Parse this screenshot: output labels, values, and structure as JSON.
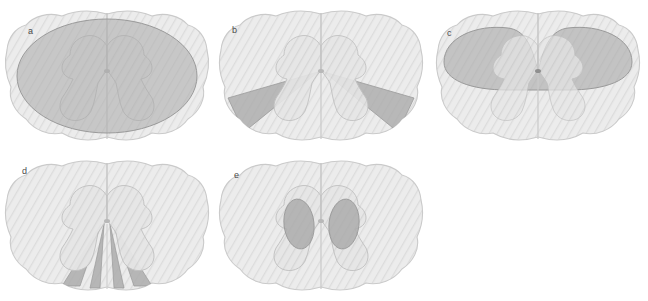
{
  "figure": {
    "background_color": "#ffffff",
    "width": 648,
    "height": 301,
    "panel_count": 5
  },
  "colors": {
    "background": "#ffffff",
    "cord_fill": "#e9e9e9",
    "cord_outline": "#c9c9c9",
    "hatch_line": "#dcdcdc",
    "gray_matter_fill": "#e2e2e2",
    "gray_matter_outline": "#c2c2c2",
    "lesion_fill": "#a9a9a9",
    "lesion_outline": "#9a9a9a",
    "midline_color": "#c4c4c4",
    "label_color": "#4a4a4a"
  },
  "panels": [
    {
      "id": "a",
      "label": "a",
      "label_x": 28,
      "label_y": 27,
      "lesion_pattern": "complete-transverse-lesion",
      "lesion_description": "Large central ellipse covering nearly the entire cord cross-section including all white and gray matter",
      "lesion_count": 1
    },
    {
      "id": "b",
      "label": "b",
      "label_x": 232,
      "label_y": 26,
      "lesion_pattern": "bilateral-anterolateral-wedges",
      "lesion_description": "Paired fan-shaped wedges in the anterolateral quadrants radiating outward from the central canal region",
      "lesion_count": 2
    },
    {
      "id": "c",
      "label": "c",
      "label_x": 447,
      "label_y": 29,
      "lesion_pattern": "posterior-column-band",
      "lesion_description": "Wide posterior band with midline V-notch spanning the dorsal columns and dorsal horns",
      "lesion_count": 1
    },
    {
      "id": "d",
      "label": "d",
      "label_x": 22,
      "label_y": 167,
      "lesion_pattern": "anterior-radiating-wedges",
      "lesion_description": "Four narrow triangular wedges radiating from the central canal to the anterior cord surface",
      "lesion_count": 4
    },
    {
      "id": "e",
      "label": "e",
      "label_x": 234,
      "label_y": 171,
      "lesion_pattern": "bilateral-central-gray-ovals",
      "lesion_description": "Paired vertical ovals within the central gray matter columns flanking the central canal",
      "lesion_count": 2
    }
  ]
}
